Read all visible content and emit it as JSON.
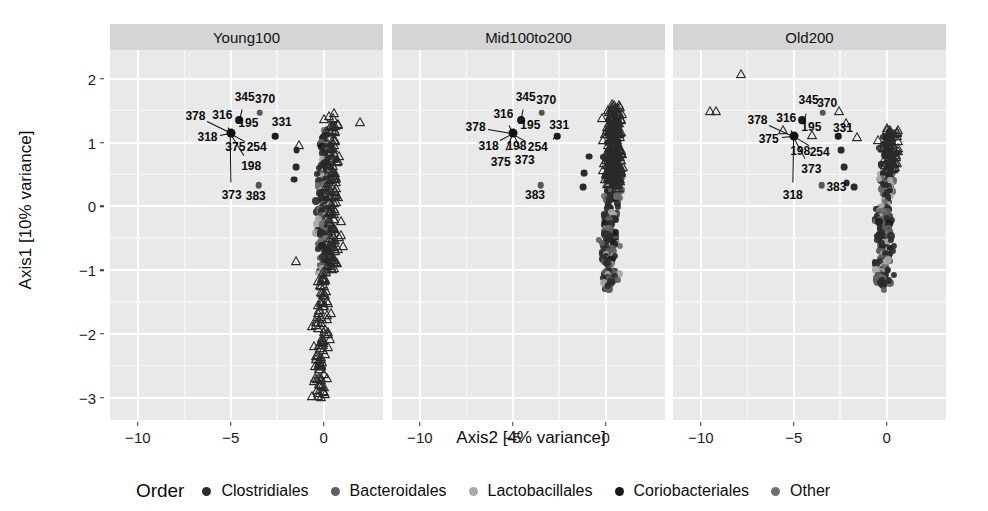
{
  "chart_data": {
    "type": "scatter",
    "title": "",
    "xlabel": "Axis2 [4% variance]",
    "ylabel": "Axis1 [10% variance]",
    "xlim": [
      -11.5,
      3.2
    ],
    "ylim": [
      -3.35,
      2.45
    ],
    "xticks": [
      -10,
      -5,
      0
    ],
    "yticks": [
      2,
      1,
      0,
      -1,
      -2,
      -3
    ],
    "xtick_labels": [
      "−10",
      "−5",
      "0"
    ],
    "ytick_labels": [
      "2",
      "1",
      "0",
      "−1",
      "−2",
      "−3"
    ],
    "grid": "major-white-minor-light",
    "legend_position": "bottom",
    "facets": [
      "Young100",
      "Mid100to200",
      "Old200"
    ],
    "legend": {
      "title": "Order",
      "entries": [
        {
          "label": "Clostridiales",
          "color": "#2b2b2b"
        },
        {
          "label": "Bacteroidales",
          "color": "#5e5e5e"
        },
        {
          "label": "Lactobacillales",
          "color": "#a9a9a9"
        },
        {
          "label": "Coriobacteriales",
          "color": "#1a1a1a"
        },
        {
          "label": "Other",
          "color": "#6e6e6e"
        }
      ]
    },
    "marker_shapes": {
      "circle": "taxa points",
      "triangle": "open triangle points"
    },
    "panels": [
      {
        "name": "Young100",
        "biplot_origin": [
          -5.0,
          1.15
        ],
        "labels": [
          {
            "id": "345",
            "lx": -4.25,
            "ly": 1.72,
            "tx": -4.55,
            "ty": 1.35
          },
          {
            "id": "370",
            "lx": -3.15,
            "ly": 1.68,
            "tx": -3.45,
            "ty": 1.47
          },
          {
            "id": "378",
            "lx": -6.9,
            "ly": 1.42,
            "tx": -5.0,
            "ty": 1.15
          },
          {
            "id": "316",
            "lx": -5.45,
            "ly": 1.43,
            "tx": -5.0,
            "ty": 1.15
          },
          {
            "id": "195",
            "lx": -4.05,
            "ly": 1.3,
            "tx": -4.55,
            "ty": 1.35
          },
          {
            "id": "331",
            "lx": -2.25,
            "ly": 1.32,
            "tx": -2.6,
            "ty": 1.1
          },
          {
            "id": "318",
            "lx": -6.25,
            "ly": 1.08,
            "tx": -5.0,
            "ty": 1.15
          },
          {
            "id": "375",
            "lx": -4.75,
            "ly": 0.93,
            "tx": -5.0,
            "ty": 1.15
          },
          {
            "id": "254",
            "lx": -3.6,
            "ly": 0.93,
            "tx": -5.0,
            "ty": 1.15
          },
          {
            "id": "198",
            "lx": -3.9,
            "ly": 0.63,
            "tx": -5.0,
            "ty": 1.15
          },
          {
            "id": "373",
            "lx": -4.95,
            "ly": 0.18,
            "tx": -5.0,
            "ty": 1.15
          },
          {
            "id": "383",
            "lx": -3.65,
            "ly": 0.16,
            "tx": -3.5,
            "ty": 0.33
          }
        ]
      },
      {
        "name": "Mid100to200",
        "biplot_origin": [
          -5.0,
          1.15
        ],
        "labels": [
          {
            "id": "345",
            "lx": -4.3,
            "ly": 1.72,
            "tx": -4.55,
            "ty": 1.35
          },
          {
            "id": "370",
            "lx": -3.2,
            "ly": 1.66,
            "tx": -3.5,
            "ty": 1.45
          },
          {
            "id": "316",
            "lx": -5.5,
            "ly": 1.45,
            "tx": -5.0,
            "ty": 1.15
          },
          {
            "id": "378",
            "lx": -7.0,
            "ly": 1.25,
            "tx": -5.0,
            "ty": 1.15
          },
          {
            "id": "195",
            "lx": -4.05,
            "ly": 1.28,
            "tx": -4.55,
            "ty": 1.35
          },
          {
            "id": "331",
            "lx": -2.5,
            "ly": 1.27,
            "tx": -2.85,
            "ty": 1.02
          },
          {
            "id": "318",
            "lx": -6.3,
            "ly": 0.95,
            "tx": -5.0,
            "ty": 1.15
          },
          {
            "id": "198",
            "lx": -4.8,
            "ly": 0.95,
            "tx": -5.0,
            "ty": 1.15
          },
          {
            "id": "254",
            "lx": -3.65,
            "ly": 0.93,
            "tx": -5.0,
            "ty": 1.15
          },
          {
            "id": "375",
            "lx": -5.65,
            "ly": 0.7,
            "tx": -5.0,
            "ty": 1.15
          },
          {
            "id": "373",
            "lx": -4.35,
            "ly": 0.72,
            "tx": -5.0,
            "ty": 1.15
          },
          {
            "id": "383",
            "lx": -3.8,
            "ly": 0.18,
            "tx": -3.6,
            "ty": 0.4
          }
        ]
      },
      {
        "name": "Old200",
        "biplot_origin": [
          -5.0,
          1.1
        ],
        "labels": [
          {
            "id": "345",
            "lx": -4.2,
            "ly": 1.66,
            "tx": -4.5,
            "ty": 1.3
          },
          {
            "id": "370",
            "lx": -3.2,
            "ly": 1.62,
            "tx": -3.55,
            "ty": 1.42
          },
          {
            "id": "316",
            "lx": -5.4,
            "ly": 1.38,
            "tx": -5.0,
            "ty": 1.1
          },
          {
            "id": "378",
            "lx": -6.95,
            "ly": 1.36,
            "tx": -5.0,
            "ty": 1.1
          },
          {
            "id": "195",
            "lx": -4.05,
            "ly": 1.24,
            "tx": -4.5,
            "ty": 1.3
          },
          {
            "id": "331",
            "lx": -2.35,
            "ly": 1.22,
            "tx": -2.7,
            "ty": 1.0
          },
          {
            "id": "375",
            "lx": -6.35,
            "ly": 1.06,
            "tx": -5.0,
            "ty": 1.1
          },
          {
            "id": "198",
            "lx": -4.65,
            "ly": 0.86,
            "tx": -5.0,
            "ty": 1.1
          },
          {
            "id": "254",
            "lx": -3.6,
            "ly": 0.85,
            "tx": -5.0,
            "ty": 1.1
          },
          {
            "id": "373",
            "lx": -4.05,
            "ly": 0.58,
            "tx": -5.0,
            "ty": 1.1
          },
          {
            "id": "318",
            "lx": -5.05,
            "ly": 0.18,
            "tx": -5.0,
            "ty": 1.1
          },
          {
            "id": "383",
            "lx": -2.7,
            "ly": 0.3,
            "tx": -3.2,
            "ty": 0.27
          }
        ]
      }
    ],
    "named_points": [
      {
        "id": "345",
        "x": -4.55,
        "y": 1.35,
        "shape": "circle",
        "color": "#1c1c1c"
      },
      {
        "id": "370",
        "x": -3.45,
        "y": 1.47,
        "shape": "circle",
        "color": "#555"
      },
      {
        "id": "331",
        "x": -2.6,
        "y": 1.1,
        "shape": "circle",
        "color": "#1c1c1c"
      },
      {
        "id": "383",
        "x": -3.5,
        "y": 0.33,
        "shape": "circle",
        "color": "#555"
      }
    ]
  }
}
